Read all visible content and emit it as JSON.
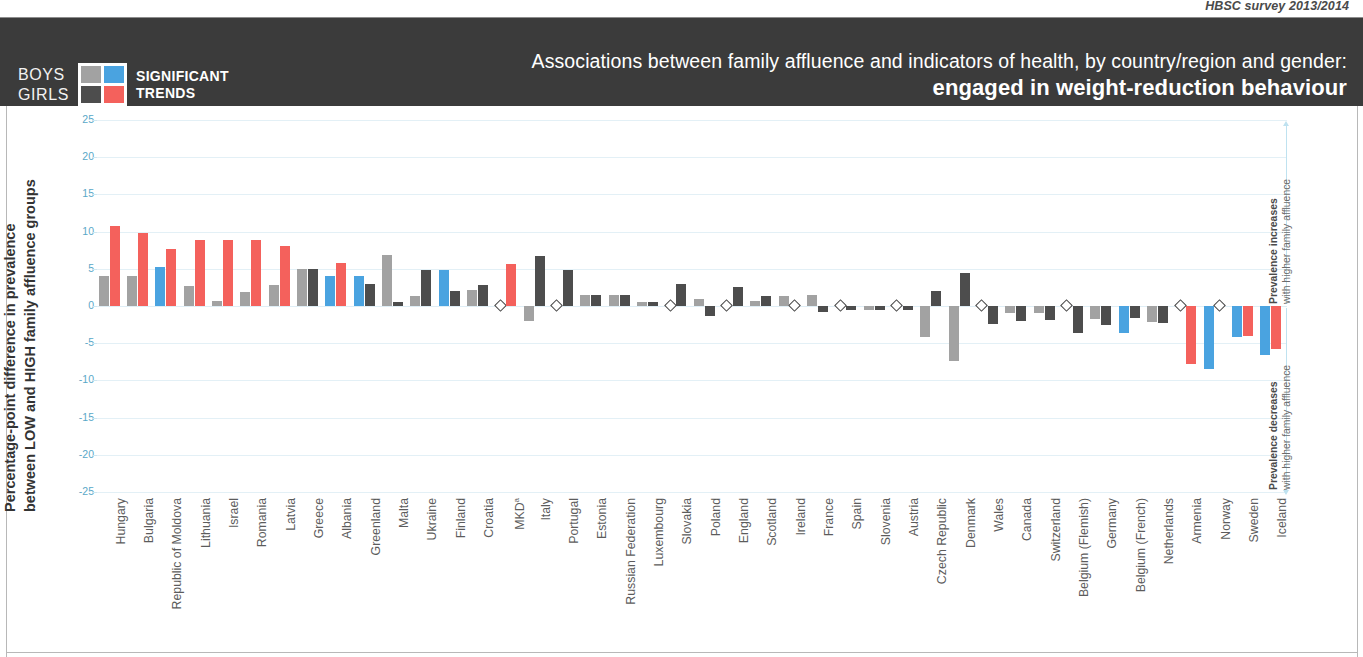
{
  "header": {
    "survey_note": "HBSC survey 2013/2014",
    "title_line1": "Associations between family affluence and indicators of health, by country/region and gender:",
    "title_line2": "engaged in weight-reduction behaviour",
    "legend": {
      "boys_label": "BOYS",
      "girls_label": "GIRLS",
      "caption_line1": "SIGNIFICANT",
      "caption_line2": "TRENDS",
      "boys_nonsig_color": "#a2a2a2",
      "boys_sig_color": "#4aa3e0",
      "girls_nonsig_color": "#4d4d4d",
      "girls_sig_color": "#f4615c"
    }
  },
  "axis": {
    "y_title_line1": "Percentage-point difference in prevalence",
    "y_title_line2": "between LOW and HIGH family affluence groups",
    "right_note_top_bold": "Prevalence increases",
    "right_note_top_rest": "with higher family affluence",
    "right_note_bottom_bold": "Prevalence decreases",
    "right_note_bottom_rest": "with higher family affluence"
  },
  "chart_data": {
    "type": "bar",
    "title": "Associations between family affluence and indicators of health, by country/region and gender: engaged in weight-reduction behaviour",
    "xlabel": "",
    "ylabel": "Percentage-point difference in prevalence between LOW and HIGH family affluence groups",
    "ylim": [
      -25,
      25
    ],
    "yticks": [
      25,
      20,
      15,
      10,
      5,
      0,
      -5,
      -10,
      -15,
      -20,
      -25
    ],
    "ytick_labels": [
      "25",
      "20",
      "15",
      "10",
      "5",
      "0",
      "-5",
      "-10",
      "-15",
      "-20",
      "-25"
    ],
    "grid": true,
    "legend_position": "top-left",
    "series": [
      {
        "name": "Boys",
        "color_nonsignificant": "#a2a2a2",
        "color_significant": "#4aa3e0"
      },
      {
        "name": "Girls",
        "color_nonsignificant": "#4d4d4d",
        "color_significant": "#f4615c"
      }
    ],
    "missing_marker": "open diamond (no data / not available)",
    "categories": [
      "Hungary",
      "Bulgaria",
      "Republic of Moldova",
      "Lithuania",
      "Israel",
      "Romania",
      "Latvia",
      "Greece",
      "Albania",
      "Greenland",
      "Malta",
      "Ukraine",
      "Finland",
      "Croatia",
      "MKD",
      "Italy",
      "Portugal",
      "Estonia",
      "Russian Federation",
      "Luxembourg",
      "Slovakia",
      "Poland",
      "England",
      "Scotland",
      "Ireland",
      "France",
      "Spain",
      "Slovenia",
      "Austria",
      "Czech Republic",
      "Denmark",
      "Wales",
      "Canada",
      "Switzerland",
      "Belgium (Flemish)",
      "Germany",
      "Belgium (French)",
      "Netherlands",
      "Armenia",
      "Norway",
      "Sweden",
      "Iceland"
    ],
    "category_labels": [
      "Hungary",
      "Bulgaria",
      "Republic of Moldova",
      "Lithuania",
      "Israel",
      "Romania",
      "Latvia",
      "Greece",
      "Albania",
      "Greenland",
      "Malta",
      "Ukraine",
      "Finland",
      "Croatia",
      "MKDᵃ",
      "Italy",
      "Portugal",
      "Estonia",
      "Russian Federation",
      "Luxembourg",
      "Slovakia",
      "Poland",
      "England",
      "Scotland",
      "Ireland",
      "France",
      "Spain",
      "Slovenia",
      "Austria",
      "Czech Republic",
      "Denmark",
      "Wales",
      "Canada",
      "Switzerland",
      "Belgium (Flemish)",
      "Germany",
      "Belgium (French)",
      "Netherlands",
      "Armenia",
      "Norway",
      "Sweden",
      "Iceland"
    ],
    "bars": [
      {
        "category": "Hungary",
        "boys": 4.0,
        "boys_sig": false,
        "girls": 10.7,
        "girls_sig": true
      },
      {
        "category": "Bulgaria",
        "boys": 4.0,
        "boys_sig": false,
        "girls": 9.8,
        "girls_sig": true
      },
      {
        "category": "Republic of Moldova",
        "boys": 5.2,
        "boys_sig": true,
        "girls": 7.6,
        "girls_sig": true
      },
      {
        "category": "Lithuania",
        "boys": 2.7,
        "boys_sig": false,
        "girls": 8.9,
        "girls_sig": true
      },
      {
        "category": "Israel",
        "boys": 0.7,
        "boys_sig": false,
        "girls": 8.9,
        "girls_sig": true
      },
      {
        "category": "Romania",
        "boys": 1.9,
        "boys_sig": false,
        "girls": 8.9,
        "girls_sig": true
      },
      {
        "category": "Latvia",
        "boys": 2.8,
        "boys_sig": false,
        "girls": 8.0,
        "girls_sig": true
      },
      {
        "category": "Greece",
        "boys": 5.0,
        "boys_sig": false,
        "girls": 5.0,
        "girls_sig": false
      },
      {
        "category": "Albania",
        "boys": 4.0,
        "boys_sig": true,
        "girls": 5.8,
        "girls_sig": true
      },
      {
        "category": "Greenland",
        "boys": 4.0,
        "boys_sig": true,
        "girls": 3.0,
        "girls_sig": false
      },
      {
        "category": "Malta",
        "boys": 6.8,
        "boys_sig": false,
        "girls": 0.5,
        "girls_sig": false
      },
      {
        "category": "Ukraine",
        "boys": 1.3,
        "boys_sig": false,
        "girls": 4.9,
        "girls_sig": false
      },
      {
        "category": "Finland",
        "boys": 4.9,
        "boys_sig": true,
        "girls": 2.0,
        "girls_sig": false
      },
      {
        "category": "Croatia",
        "boys": 2.1,
        "boys_sig": false,
        "girls": 2.8,
        "girls_sig": false
      },
      {
        "category": "MKD",
        "boys": null,
        "boys_sig": false,
        "girls": 5.7,
        "girls_sig": true
      },
      {
        "category": "Italy",
        "boys": -2.0,
        "boys_sig": false,
        "girls": 6.7,
        "girls_sig": false
      },
      {
        "category": "Portugal",
        "boys": null,
        "boys_sig": false,
        "girls": 4.9,
        "girls_sig": false
      },
      {
        "category": "Estonia",
        "boys": 1.5,
        "boys_sig": false,
        "girls": 1.5,
        "girls_sig": false
      },
      {
        "category": "Russian Federation",
        "boys": 1.5,
        "boys_sig": false,
        "girls": 1.5,
        "girls_sig": false
      },
      {
        "category": "Luxembourg",
        "boys": 0.6,
        "boys_sig": false,
        "girls": 0.6,
        "girls_sig": false
      },
      {
        "category": "Slovakia",
        "boys": null,
        "boys_sig": false,
        "girls": 3.0,
        "girls_sig": false
      },
      {
        "category": "Poland",
        "boys": 1.0,
        "boys_sig": false,
        "girls": -1.4,
        "girls_sig": false
      },
      {
        "category": "England",
        "boys": null,
        "boys_sig": false,
        "girls": 2.6,
        "girls_sig": false
      },
      {
        "category": "Scotland",
        "boys": 0.7,
        "boys_sig": false,
        "girls": 1.3,
        "girls_sig": false
      },
      {
        "category": "Ireland",
        "boys": 1.3,
        "boys_sig": false,
        "girls": null,
        "girls_sig": false
      },
      {
        "category": "France",
        "boys": 1.5,
        "boys_sig": false,
        "girls": -0.8,
        "girls_sig": false
      },
      {
        "category": "Spain",
        "boys": null,
        "boys_sig": false,
        "girls": -0.6,
        "girls_sig": false
      },
      {
        "category": "Slovenia",
        "boys": -0.5,
        "boys_sig": false,
        "girls": -0.5,
        "girls_sig": false
      },
      {
        "category": "Austria",
        "boys": null,
        "boys_sig": false,
        "girls": -0.6,
        "girls_sig": false
      },
      {
        "category": "Czech Republic",
        "boys": -4.2,
        "boys_sig": false,
        "girls": 2.0,
        "girls_sig": false
      },
      {
        "category": "Denmark",
        "boys": -7.4,
        "boys_sig": false,
        "girls": 4.4,
        "girls_sig": false
      },
      {
        "category": "Wales",
        "boys": null,
        "boys_sig": false,
        "girls": -2.4,
        "girls_sig": false
      },
      {
        "category": "Canada",
        "boys": -1.0,
        "boys_sig": false,
        "girls": -2.0,
        "girls_sig": false
      },
      {
        "category": "Switzerland",
        "boys": -1.0,
        "boys_sig": false,
        "girls": -1.9,
        "girls_sig": false
      },
      {
        "category": "Belgium (Flemish)",
        "boys": null,
        "boys_sig": false,
        "girls": -3.6,
        "girls_sig": false
      },
      {
        "category": "Germany",
        "boys": -1.8,
        "boys_sig": false,
        "girls": -2.6,
        "girls_sig": false
      },
      {
        "category": "Belgium (French)",
        "boys": -3.6,
        "boys_sig": true,
        "girls": -1.6,
        "girls_sig": false
      },
      {
        "category": "Netherlands",
        "boys": -2.2,
        "boys_sig": false,
        "girls": -2.3,
        "girls_sig": false
      },
      {
        "category": "Armenia",
        "boys": null,
        "boys_sig": false,
        "girls": -7.8,
        "girls_sig": true
      },
      {
        "category": "Norway",
        "boys": -8.5,
        "boys_sig": true,
        "girls": null,
        "girls_sig": false
      },
      {
        "category": "Sweden",
        "boys": -4.2,
        "boys_sig": true,
        "girls": -4.0,
        "girls_sig": true
      },
      {
        "category": "Iceland",
        "boys": -6.6,
        "boys_sig": true,
        "girls": -5.8,
        "girls_sig": true
      }
    ]
  }
}
